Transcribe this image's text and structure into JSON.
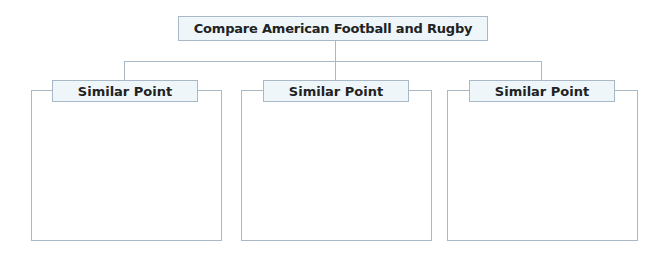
{
  "diagram": {
    "title": "Compare American Football and Rugby",
    "columns": [
      {
        "label": "Similar Point",
        "content": ""
      },
      {
        "label": "Similar Point",
        "content": ""
      },
      {
        "label": "Similar Point",
        "content": ""
      }
    ],
    "colors": {
      "border": "#a9b8c6",
      "label_fill": "#eef6fa",
      "text": "#222222"
    }
  }
}
